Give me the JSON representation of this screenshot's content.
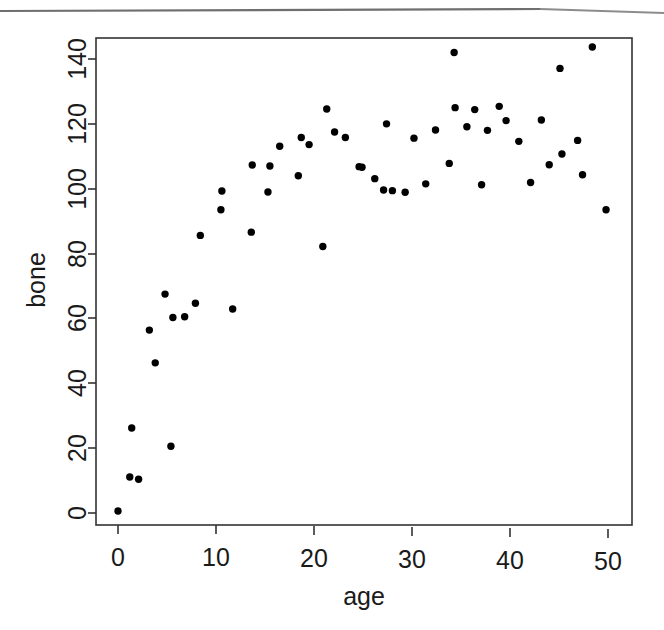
{
  "figure": {
    "kind": "scatterplot",
    "background_color": "#ffffff",
    "foreground_color": "#000000",
    "frame_color": "#333333",
    "point_color": "#000000"
  },
  "chart_data": {
    "type": "scatter",
    "title": "",
    "xlabel": "age",
    "ylabel": "bone",
    "xlim": [
      -1.5,
      52.0
    ],
    "ylim": [
      -4.0,
      148.0
    ],
    "xticks": [
      0,
      10,
      20,
      30,
      40,
      50
    ],
    "yticks": [
      0,
      20,
      40,
      60,
      80,
      100,
      120,
      140
    ],
    "xtick_labels": [
      "0",
      "10",
      "20",
      "30",
      "40",
      "50"
    ],
    "ytick_labels": [
      "0",
      "20",
      "40",
      "60",
      "80",
      "100",
      "120",
      "140"
    ],
    "grid": false,
    "legend": null,
    "marker": "filled-circle",
    "marker_size_px": 5,
    "n_points": 56,
    "series": [
      {
        "name": "bone vs age",
        "points": [
          [
            0.0,
            0.6
          ],
          [
            1.2,
            11.1
          ],
          [
            1.4,
            26.2
          ],
          [
            2.1,
            10.4
          ],
          [
            3.2,
            56.4
          ],
          [
            3.8,
            46.3
          ],
          [
            4.8,
            67.5
          ],
          [
            5.4,
            20.6
          ],
          [
            5.6,
            60.3
          ],
          [
            6.8,
            60.5
          ],
          [
            7.9,
            64.7
          ],
          [
            8.4,
            85.6
          ],
          [
            10.5,
            93.5
          ],
          [
            10.6,
            99.3
          ],
          [
            11.7,
            62.9
          ],
          [
            13.6,
            86.6
          ],
          [
            13.7,
            107.3
          ],
          [
            15.3,
            99.0
          ],
          [
            15.5,
            107.0
          ],
          [
            16.5,
            113.1
          ],
          [
            18.4,
            104.0
          ],
          [
            18.7,
            115.8
          ],
          [
            19.5,
            113.6
          ],
          [
            20.9,
            82.2
          ],
          [
            21.3,
            124.6
          ],
          [
            22.1,
            117.5
          ],
          [
            23.2,
            115.8
          ],
          [
            24.6,
            106.8
          ],
          [
            26.2,
            103.1
          ],
          [
            27.1,
            99.6
          ],
          [
            27.4,
            120.0
          ],
          [
            29.3,
            98.9
          ],
          [
            30.2,
            115.6
          ],
          [
            31.4,
            101.5
          ],
          [
            32.4,
            118.1
          ],
          [
            33.8,
            107.8
          ],
          [
            34.3,
            142.0
          ],
          [
            34.4,
            125.0
          ],
          [
            35.6,
            119.1
          ],
          [
            36.4,
            124.4
          ],
          [
            37.1,
            101.2
          ],
          [
            37.7,
            118.0
          ],
          [
            38.9,
            125.4
          ],
          [
            39.6,
            121.0
          ],
          [
            40.9,
            114.6
          ],
          [
            42.1,
            101.9
          ],
          [
            43.2,
            121.2
          ],
          [
            44.0,
            107.4
          ],
          [
            45.1,
            137.1
          ],
          [
            45.3,
            110.7
          ],
          [
            46.9,
            114.9
          ],
          [
            47.4,
            104.3
          ],
          [
            48.4,
            143.7
          ],
          [
            49.8,
            93.5
          ],
          [
            24.9,
            106.6
          ],
          [
            28.0,
            99.4
          ]
        ]
      }
    ]
  },
  "axes": {
    "x_axis_label": "age",
    "y_axis_label": "bone"
  }
}
